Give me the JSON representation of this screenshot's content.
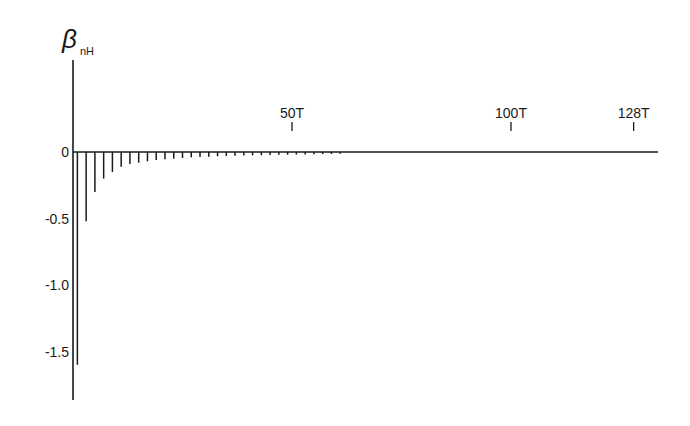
{
  "chart_data": {
    "type": "bar",
    "subtype": "stem",
    "title": "",
    "ylabel": "β",
    "ylabel_subscript": "nH",
    "xlabel": "",
    "ylim": [
      -1.8,
      0.6
    ],
    "xlim": [
      0,
      135
    ],
    "y_ticks": [
      {
        "value": 0,
        "label": "0"
      },
      {
        "value": -0.5,
        "label": "-0.5"
      },
      {
        "value": -1.0,
        "label": "-1.0"
      },
      {
        "value": -1.5,
        "label": "-1.5"
      }
    ],
    "x_ticks": [
      {
        "value": 50,
        "label": "50T"
      },
      {
        "value": 100,
        "label": "100T"
      },
      {
        "value": 128,
        "label": "128T"
      }
    ],
    "grid": false,
    "legend": null,
    "x": [
      1,
      3,
      5,
      7,
      9,
      11,
      13,
      15,
      17,
      19,
      21,
      23,
      25,
      27,
      29,
      31,
      33,
      35,
      37,
      39,
      41,
      43,
      45,
      47,
      49,
      51,
      53,
      55,
      57,
      59,
      61
    ],
    "values": [
      -1.6,
      -0.52,
      -0.3,
      -0.2,
      -0.15,
      -0.11,
      -0.09,
      -0.08,
      -0.07,
      -0.06,
      -0.055,
      -0.05,
      -0.045,
      -0.04,
      -0.038,
      -0.035,
      -0.032,
      -0.03,
      -0.028,
      -0.026,
      -0.025,
      -0.024,
      -0.022,
      -0.021,
      -0.02,
      -0.019,
      -0.018,
      -0.017,
      -0.016,
      -0.015,
      -0.014
    ]
  },
  "layout": {
    "origin_x": 73,
    "zero_y": 152,
    "px_per_T": 4.38,
    "px_per_unit_y": 133,
    "axis_end_x": 658,
    "yaxis_top": 60,
    "yaxis_bottom": 400
  }
}
